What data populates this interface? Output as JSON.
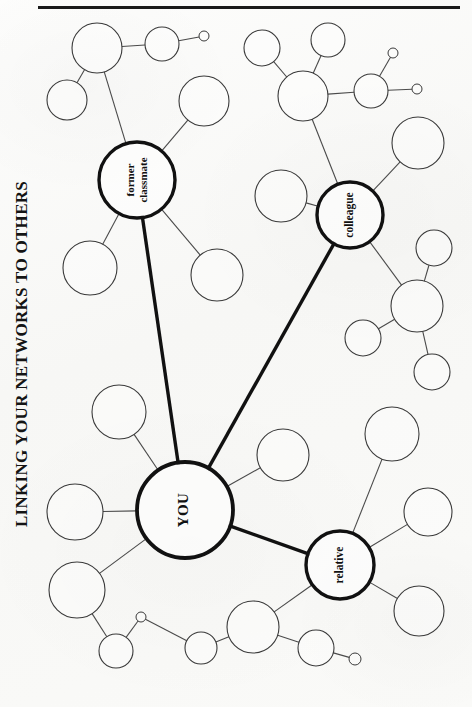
{
  "page": {
    "title": "LINKING YOUR NETWORKS TO OTHERS",
    "background_color": "#fbfbfa",
    "ink_color": "#111111",
    "rule_color": "#1a1a1a",
    "width": 472,
    "height": 707
  },
  "chart_data": {
    "type": "diagram",
    "subtype": "node-link-network",
    "title": "LINKING YOUR NETWORKS TO OTHERS",
    "labeled_nodes": [
      {
        "id": "you",
        "label": "YOU",
        "cx": 185,
        "cy": 510,
        "r": 48,
        "emphasis": "heavy",
        "label_rotation": -90
      },
      {
        "id": "former_classmate",
        "label": "former\nclassmate",
        "cx": 137,
        "cy": 180,
        "r": 38,
        "emphasis": "heavy",
        "label_rotation": -90
      },
      {
        "id": "colleague",
        "label": "colleague",
        "cx": 350,
        "cy": 215,
        "r": 33,
        "emphasis": "heavy",
        "label_rotation": -90
      },
      {
        "id": "relative",
        "label": "relative",
        "cx": 340,
        "cy": 565,
        "r": 34,
        "emphasis": "heavy",
        "label_rotation": -90
      }
    ],
    "blank_nodes": [
      {
        "id": "n01",
        "cx": 97,
        "cy": 48,
        "r": 25
      },
      {
        "id": "n02",
        "cx": 162,
        "cy": 44,
        "r": 17
      },
      {
        "id": "n03",
        "cx": 204,
        "cy": 36,
        "r": 5
      },
      {
        "id": "n04",
        "cx": 67,
        "cy": 100,
        "r": 20
      },
      {
        "id": "n05",
        "cx": 204,
        "cy": 101,
        "r": 25
      },
      {
        "id": "n06",
        "cx": 262,
        "cy": 48,
        "r": 18
      },
      {
        "id": "n07",
        "cx": 328,
        "cy": 40,
        "r": 17
      },
      {
        "id": "n08",
        "cx": 303,
        "cy": 96,
        "r": 25
      },
      {
        "id": "n09",
        "cx": 371,
        "cy": 91,
        "r": 17
      },
      {
        "id": "n10",
        "cx": 393,
        "cy": 53,
        "r": 5
      },
      {
        "id": "n11",
        "cx": 417,
        "cy": 89,
        "r": 5
      },
      {
        "id": "n12",
        "cx": 418,
        "cy": 143,
        "r": 26
      },
      {
        "id": "n13",
        "cx": 90,
        "cy": 268,
        "r": 27
      },
      {
        "id": "n14",
        "cx": 217,
        "cy": 275,
        "r": 26
      },
      {
        "id": "n15",
        "cx": 281,
        "cy": 196,
        "r": 26
      },
      {
        "id": "n16",
        "cx": 434,
        "cy": 248,
        "r": 18
      },
      {
        "id": "n17",
        "cx": 417,
        "cy": 306,
        "r": 26
      },
      {
        "id": "n18",
        "cx": 363,
        "cy": 338,
        "r": 18
      },
      {
        "id": "n19",
        "cx": 432,
        "cy": 372,
        "r": 18
      },
      {
        "id": "n20",
        "cx": 119,
        "cy": 412,
        "r": 27
      },
      {
        "id": "n21",
        "cx": 283,
        "cy": 455,
        "r": 26
      },
      {
        "id": "n22",
        "cx": 392,
        "cy": 434,
        "r": 27
      },
      {
        "id": "n23",
        "cx": 75,
        "cy": 512,
        "r": 28
      },
      {
        "id": "n24",
        "cx": 428,
        "cy": 512,
        "r": 24
      },
      {
        "id": "n25",
        "cx": 77,
        "cy": 590,
        "r": 28
      },
      {
        "id": "n26",
        "cx": 116,
        "cy": 651,
        "r": 17
      },
      {
        "id": "n27",
        "cx": 141,
        "cy": 617,
        "r": 5
      },
      {
        "id": "n28",
        "cx": 201,
        "cy": 648,
        "r": 16
      },
      {
        "id": "n29",
        "cx": 253,
        "cy": 627,
        "r": 26
      },
      {
        "id": "n30",
        "cx": 316,
        "cy": 648,
        "r": 18
      },
      {
        "id": "n31",
        "cx": 355,
        "cy": 659,
        "r": 6
      },
      {
        "id": "n32",
        "cx": 419,
        "cy": 611,
        "r": 25
      }
    ],
    "edges_strong": [
      {
        "from": "you",
        "to": "former_classmate"
      },
      {
        "from": "you",
        "to": "colleague"
      },
      {
        "from": "you",
        "to": "relative"
      }
    ],
    "edges_thin": [
      {
        "from": "n01",
        "to": "n02"
      },
      {
        "from": "n02",
        "to": "n03"
      },
      {
        "from": "n01",
        "to": "n04"
      },
      {
        "from": "n01",
        "to": "former_classmate"
      },
      {
        "from": "n05",
        "to": "former_classmate"
      },
      {
        "from": "former_classmate",
        "to": "n13"
      },
      {
        "from": "former_classmate",
        "to": "n14"
      },
      {
        "from": "n06",
        "to": "n08"
      },
      {
        "from": "n07",
        "to": "n08"
      },
      {
        "from": "n08",
        "to": "n09"
      },
      {
        "from": "n09",
        "to": "n10"
      },
      {
        "from": "n09",
        "to": "n11"
      },
      {
        "from": "n08",
        "to": "colleague"
      },
      {
        "from": "n12",
        "to": "colleague"
      },
      {
        "from": "n15",
        "to": "colleague"
      },
      {
        "from": "colleague",
        "to": "n17"
      },
      {
        "from": "n16",
        "to": "n17"
      },
      {
        "from": "n17",
        "to": "n18"
      },
      {
        "from": "n17",
        "to": "n19"
      },
      {
        "from": "n20",
        "to": "you"
      },
      {
        "from": "n21",
        "to": "you"
      },
      {
        "from": "n23",
        "to": "you"
      },
      {
        "from": "you",
        "to": "n25"
      },
      {
        "from": "n22",
        "to": "relative"
      },
      {
        "from": "relative",
        "to": "n24"
      },
      {
        "from": "relative",
        "to": "n32"
      },
      {
        "from": "relative",
        "to": "n29"
      },
      {
        "from": "n25",
        "to": "n26"
      },
      {
        "from": "n26",
        "to": "n27"
      },
      {
        "from": "n27",
        "to": "n28"
      },
      {
        "from": "n28",
        "to": "n29"
      },
      {
        "from": "n29",
        "to": "n30"
      },
      {
        "from": "n30",
        "to": "n31"
      }
    ],
    "legend": []
  }
}
